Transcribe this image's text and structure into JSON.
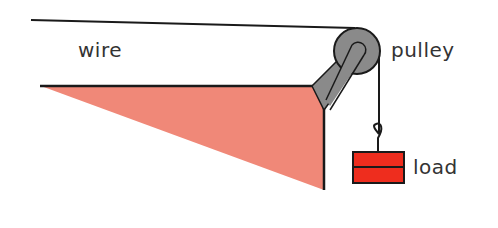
{
  "labels": {
    "wire": "wire",
    "pulley": "pulley",
    "load": "load"
  },
  "colors": {
    "triangle": "#f08878",
    "pulley": "#8a8a8a",
    "load": "#ee2d1e",
    "line": "#1a1a1a"
  }
}
